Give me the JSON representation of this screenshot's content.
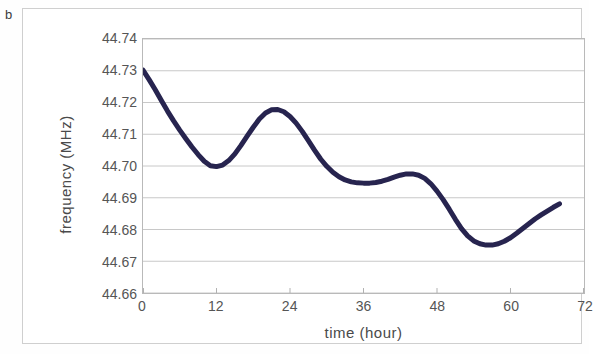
{
  "figure": {
    "panel_letter": "b",
    "background_color": "#ffffff",
    "frame_color": "#cfcfcf"
  },
  "chart_data": {
    "type": "line",
    "title": "",
    "subtitle": "",
    "xlabel": "time (hour)",
    "ylabel": "frequency (MHz)",
    "xlim": [
      0,
      72
    ],
    "ylim": [
      44.66,
      44.74
    ],
    "xticks": [
      0,
      12,
      24,
      36,
      48,
      60,
      72
    ],
    "xtick_labels": [
      "0",
      "12",
      "24",
      "36",
      "48",
      "60",
      "72"
    ],
    "yticks": [
      44.66,
      44.67,
      44.68,
      44.69,
      44.7,
      44.71,
      44.72,
      44.73,
      44.74
    ],
    "ytick_labels": [
      "44.66",
      "44.67",
      "44.68",
      "44.69",
      "44.70",
      "44.71",
      "44.72",
      "44.73",
      "44.74"
    ],
    "grid": "horizontal",
    "grid_color": "#c8c8c8",
    "legend": "none",
    "series": [
      {
        "name": "frequency",
        "color": "#27244f",
        "line_width": 5,
        "marker": "none",
        "x": [
          0,
          1,
          2,
          3,
          4,
          5,
          6,
          7,
          8,
          9,
          10,
          11,
          12,
          13,
          14,
          15,
          16,
          17,
          18,
          19,
          20,
          21,
          22,
          23,
          24,
          25,
          26,
          27,
          28,
          29,
          30,
          31,
          32,
          33,
          34,
          35,
          36,
          37,
          38,
          39,
          40,
          41,
          42,
          43,
          44,
          45,
          46,
          47,
          48,
          49,
          50,
          51,
          52,
          53,
          54,
          55,
          56,
          57,
          58,
          59,
          60,
          61,
          62,
          63,
          64,
          65,
          66,
          67,
          68
        ],
        "y": [
          44.7302,
          44.7272,
          44.724,
          44.7206,
          44.7173,
          44.7142,
          44.7113,
          44.7086,
          44.706,
          44.7036,
          44.7015,
          44.7001,
          44.6998,
          44.7003,
          44.7017,
          44.7038,
          44.7065,
          44.7094,
          44.7122,
          44.7148,
          44.7167,
          44.7177,
          44.7178,
          44.7171,
          44.7156,
          44.7135,
          44.7109,
          44.708,
          44.705,
          44.7022,
          44.6999,
          44.698,
          44.6966,
          44.6956,
          44.695,
          44.6947,
          44.6946,
          44.6946,
          44.6948,
          44.6952,
          44.6958,
          44.6965,
          44.6971,
          44.6975,
          44.6975,
          44.6971,
          44.6961,
          44.6944,
          44.6921,
          44.6894,
          44.6864,
          44.6832,
          44.6803,
          44.678,
          44.6764,
          44.6755,
          44.6751,
          44.6751,
          44.6755,
          44.6763,
          44.6774,
          44.6788,
          44.6803,
          44.6818,
          44.6833,
          44.6846,
          44.6858,
          44.687,
          44.6881
        ]
      }
    ],
    "annotations": [
      {
        "text": "b",
        "position": "outside-top-left"
      }
    ]
  }
}
